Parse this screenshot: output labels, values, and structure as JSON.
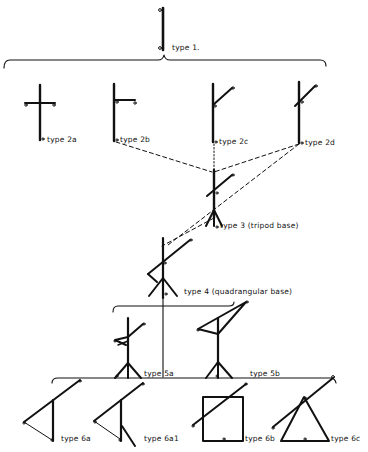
{
  "diagram": {
    "kind": "evolutionary typology of pole/frame structures",
    "ink_color": "#111111",
    "background": "#ffffff",
    "nodes": [
      {
        "id": "t1",
        "label": "type 1."
      },
      {
        "id": "t2a",
        "label": "type 2a"
      },
      {
        "id": "t2b",
        "label": "type 2b"
      },
      {
        "id": "t2c",
        "label": "type 2c"
      },
      {
        "id": "t2d",
        "label": "type 2d"
      },
      {
        "id": "t3",
        "label": "type 3 (tripod base)"
      },
      {
        "id": "t4",
        "label": "type 4 (quadrangular base)"
      },
      {
        "id": "t5a",
        "label": "type 5a"
      },
      {
        "id": "t5b",
        "label": "type 5b"
      },
      {
        "id": "t6a",
        "label": "type 6a"
      },
      {
        "id": "t6a1",
        "label": "type 6a1"
      },
      {
        "id": "t6b",
        "label": "type 6b"
      },
      {
        "id": "t6c",
        "label": "type 6c"
      }
    ],
    "edges": [
      {
        "from": "t1",
        "to": [
          "t2a",
          "t2b",
          "t2c",
          "t2d"
        ],
        "style": "brace"
      },
      {
        "from": "t2b",
        "to": "t3",
        "style": "dashed"
      },
      {
        "from": "t2c",
        "to": "t3",
        "style": "dotted"
      },
      {
        "from": "t2d",
        "to": "t3",
        "style": "dashed"
      },
      {
        "from": "t2d",
        "to": "t4",
        "style": "dashed"
      },
      {
        "from": "t3",
        "to": "t4",
        "style": "dashed"
      },
      {
        "from": "t4",
        "to": [
          "t5a",
          "t5b"
        ],
        "style": "brace"
      },
      {
        "from": "t5a",
        "to": [
          "t6a",
          "t6a1",
          "t6b",
          "t6c"
        ],
        "style": "brace"
      }
    ]
  }
}
